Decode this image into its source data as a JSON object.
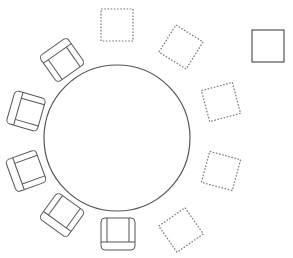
{
  "diagram": {
    "type": "seating-layout",
    "background": "#ffffff",
    "stroke_color": "#555555",
    "dotted_color": "#777777",
    "table": {
      "shape": "circle",
      "cx": 117,
      "cy": 138,
      "r": 73
    },
    "chairs": [
      {
        "id": "chair-1",
        "cx": 62,
        "cy": 60,
        "rotation": 145
      },
      {
        "id": "chair-2",
        "cx": 26,
        "cy": 111,
        "rotation": 106
      },
      {
        "id": "chair-3",
        "cx": 26,
        "cy": 171,
        "rotation": 70
      },
      {
        "id": "chair-4",
        "cx": 62,
        "cy": 215,
        "rotation": 36
      },
      {
        "id": "chair-5",
        "cx": 118,
        "cy": 234,
        "rotation": 0
      }
    ],
    "empty_slots": [
      {
        "id": "slot-1",
        "cx": 117,
        "cy": 25,
        "rotation": 0
      },
      {
        "id": "slot-2",
        "cx": 181,
        "cy": 47,
        "rotation": 32
      },
      {
        "id": "slot-3",
        "cx": 221,
        "cy": 102,
        "rotation": -15
      },
      {
        "id": "slot-4",
        "cx": 221,
        "cy": 171,
        "rotation": 15
      },
      {
        "id": "slot-5",
        "cx": 181,
        "cy": 230,
        "rotation": -35
      }
    ],
    "standalone_item": {
      "shape": "square",
      "x": 252,
      "y": 30,
      "size": 32
    }
  }
}
